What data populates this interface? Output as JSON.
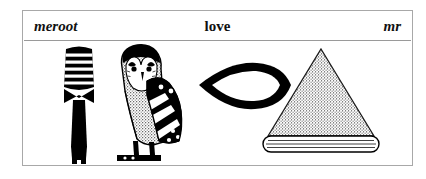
{
  "panel": {
    "header": {
      "left_label": "meroot",
      "center_label": "love",
      "right_label": "mr"
    },
    "glyphs": [
      {
        "name": "chisel-hieroglyph",
        "description": "Egyptian hoe/chisel sign with banded head",
        "fill": "#000000"
      },
      {
        "name": "owl-hieroglyph",
        "description": "Egyptian owl sign, stippled body with striped wing",
        "fill": "#000000"
      },
      {
        "name": "mouth-hieroglyph",
        "description": "Egyptian mouth sign, lens-shaped outline",
        "fill": "#000000"
      },
      {
        "name": "pyramid-hieroglyph",
        "description": "Egyptian pyramid sign on a lined base bar",
        "fill": "#000000"
      }
    ]
  },
  "colors": {
    "ink": "#000000",
    "frame": "#a8a8a8",
    "rule": "#9a9a9a",
    "paper": "#ffffff",
    "stipple": "#767676"
  }
}
